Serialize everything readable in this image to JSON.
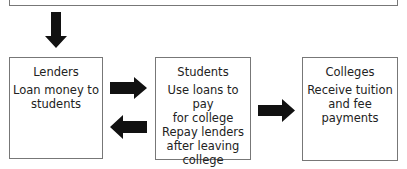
{
  "diagram": {
    "top_box": {
      "label": ""
    },
    "nodes": [
      {
        "id": "lenders",
        "title": "Lenders",
        "lines": [
          "Loan money to",
          "students"
        ]
      },
      {
        "id": "students",
        "title": "Students",
        "lines": [
          "Use loans to pay",
          "for college",
          "Repay lenders",
          "after leaving",
          "college"
        ]
      },
      {
        "id": "colleges",
        "title": "Colleges",
        "lines": [
          "Receive tuition",
          "and fee",
          "payments"
        ]
      }
    ],
    "edges": [
      {
        "from": "top_box",
        "to": "lenders",
        "direction": "down"
      },
      {
        "from": "lenders",
        "to": "students",
        "direction": "right"
      },
      {
        "from": "students",
        "to": "lenders",
        "direction": "left"
      },
      {
        "from": "students",
        "to": "colleges",
        "direction": "right"
      }
    ],
    "colors": {
      "arrow": "#111111",
      "border": "#777777",
      "text": "#222222"
    }
  }
}
